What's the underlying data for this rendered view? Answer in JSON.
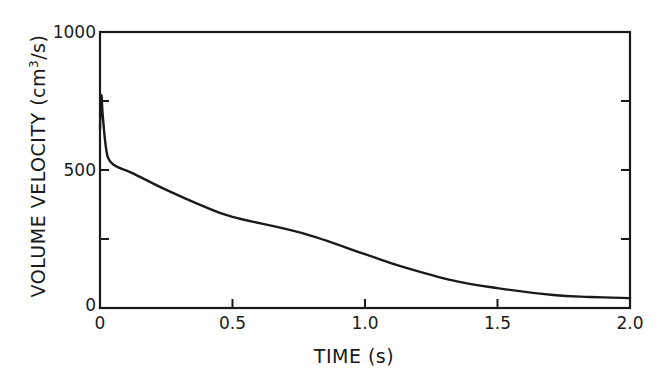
{
  "chart_data": {
    "type": "line",
    "title": "",
    "xlabel": "TIME (s)",
    "ylabel": "VOLUME VELOCITY (cm³/s)",
    "ylabel_parts": {
      "main": "VOLUME VELOCITY (cm",
      "sup": "3",
      "end": "/s)"
    },
    "xlim": [
      0,
      2.0
    ],
    "ylim": [
      0,
      1000
    ],
    "x_ticks": [
      0,
      0.5,
      1.0,
      1.5,
      2.0
    ],
    "x_tick_labels": [
      "0",
      "0.5",
      "1.0",
      "1.5",
      "2.0"
    ],
    "y_ticks": [
      0,
      250,
      500,
      750,
      1000
    ],
    "y_tick_labels": [
      "0",
      "",
      "500",
      "",
      "1000"
    ],
    "grid": false,
    "legend": null,
    "series": [
      {
        "name": "volume velocity",
        "x": [
          0.0,
          0.005,
          0.01,
          0.02,
          0.03,
          0.05,
          0.08,
          0.12,
          0.25,
          0.38,
          0.5,
          0.76,
          1.0,
          1.14,
          1.33,
          1.5,
          1.71,
          1.85,
          2.0
        ],
        "y": [
          650,
          770,
          700,
          600,
          545,
          520,
          505,
          490,
          428,
          373,
          330,
          272,
          195,
          150,
          100,
          72,
          47,
          40,
          36
        ]
      }
    ]
  }
}
